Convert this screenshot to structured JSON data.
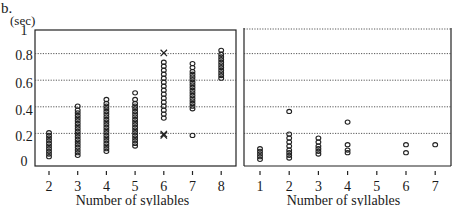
{
  "figure_label": "b.",
  "y_unit": "(sec)",
  "chart_data": [
    {
      "type": "scatter",
      "title": "",
      "xlabel": "Number of syllables",
      "ylabel": "(sec)",
      "xlim": [
        2,
        8
      ],
      "ylim": [
        0,
        1
      ],
      "xticks": [
        2,
        3,
        4,
        5,
        6,
        7,
        8
      ],
      "yticks": [
        0,
        0.2,
        0.4,
        0.6,
        0.8,
        1
      ],
      "ytick_labels": [
        "0",
        "0.2",
        "0.4",
        "0.6",
        "0.8",
        "1"
      ],
      "grid": "horizontal dotted at 0.2, 0.4, 0.6, 0.8",
      "series": [
        {
          "name": "circles",
          "marker": "o",
          "points": [
            [
              2,
              0.04
            ],
            [
              2,
              0.06
            ],
            [
              2,
              0.08
            ],
            [
              2,
              0.1
            ],
            [
              2,
              0.12
            ],
            [
              2,
              0.14
            ],
            [
              2,
              0.16
            ],
            [
              2,
              0.18
            ],
            [
              2,
              0.2
            ],
            [
              2,
              0.22
            ],
            [
              3,
              0.05
            ],
            [
              3,
              0.07
            ],
            [
              3,
              0.09
            ],
            [
              3,
              0.11
            ],
            [
              3,
              0.13
            ],
            [
              3,
              0.15
            ],
            [
              3,
              0.17
            ],
            [
              3,
              0.19
            ],
            [
              3,
              0.21
            ],
            [
              3,
              0.23
            ],
            [
              3,
              0.25
            ],
            [
              3,
              0.27
            ],
            [
              3,
              0.29
            ],
            [
              3,
              0.31
            ],
            [
              3,
              0.33
            ],
            [
              3,
              0.35
            ],
            [
              3,
              0.37
            ],
            [
              3,
              0.39
            ],
            [
              3,
              0.42
            ],
            [
              4,
              0.08
            ],
            [
              4,
              0.1
            ],
            [
              4,
              0.12
            ],
            [
              4,
              0.14
            ],
            [
              4,
              0.16
            ],
            [
              4,
              0.18
            ],
            [
              4,
              0.2
            ],
            [
              4,
              0.22
            ],
            [
              4,
              0.24
            ],
            [
              4,
              0.26
            ],
            [
              4,
              0.28
            ],
            [
              4,
              0.3
            ],
            [
              4,
              0.32
            ],
            [
              4,
              0.34
            ],
            [
              4,
              0.36
            ],
            [
              4,
              0.38
            ],
            [
              4,
              0.4
            ],
            [
              4,
              0.42
            ],
            [
              4,
              0.44
            ],
            [
              4,
              0.47
            ],
            [
              5,
              0.12
            ],
            [
              5,
              0.14
            ],
            [
              5,
              0.16
            ],
            [
              5,
              0.18
            ],
            [
              5,
              0.2
            ],
            [
              5,
              0.22
            ],
            [
              5,
              0.24
            ],
            [
              5,
              0.26
            ],
            [
              5,
              0.28
            ],
            [
              5,
              0.3
            ],
            [
              5,
              0.32
            ],
            [
              5,
              0.34
            ],
            [
              5,
              0.36
            ],
            [
              5,
              0.38
            ],
            [
              5,
              0.4
            ],
            [
              5,
              0.42
            ],
            [
              5,
              0.44
            ],
            [
              5,
              0.47
            ],
            [
              5,
              0.52
            ],
            [
              6,
              0.33
            ],
            [
              6,
              0.36
            ],
            [
              6,
              0.39
            ],
            [
              6,
              0.42
            ],
            [
              6,
              0.45
            ],
            [
              6,
              0.48
            ],
            [
              6,
              0.51
            ],
            [
              6,
              0.54
            ],
            [
              6,
              0.57
            ],
            [
              6,
              0.6
            ],
            [
              6,
              0.63
            ],
            [
              6,
              0.66
            ],
            [
              6,
              0.69
            ],
            [
              6,
              0.72
            ],
            [
              6,
              0.75
            ],
            [
              7,
              0.2
            ],
            [
              7,
              0.4
            ],
            [
              7,
              0.42
            ],
            [
              7,
              0.44
            ],
            [
              7,
              0.46
            ],
            [
              7,
              0.48
            ],
            [
              7,
              0.5
            ],
            [
              7,
              0.52
            ],
            [
              7,
              0.54
            ],
            [
              7,
              0.56
            ],
            [
              7,
              0.58
            ],
            [
              7,
              0.6
            ],
            [
              7,
              0.62
            ],
            [
              7,
              0.64
            ],
            [
              7,
              0.66
            ],
            [
              7,
              0.68
            ],
            [
              7,
              0.71
            ],
            [
              7,
              0.74
            ],
            [
              8,
              0.63
            ],
            [
              8,
              0.65
            ],
            [
              8,
              0.67
            ],
            [
              8,
              0.69
            ],
            [
              8,
              0.71
            ],
            [
              8,
              0.73
            ],
            [
              8,
              0.75
            ],
            [
              8,
              0.77
            ],
            [
              8,
              0.79
            ],
            [
              8,
              0.81
            ],
            [
              8,
              0.84
            ]
          ]
        },
        {
          "name": "crosses",
          "marker": "x",
          "points": [
            [
              6,
              0.82
            ],
            [
              6,
              0.2
            ],
            [
              6,
              0.21
            ]
          ]
        }
      ]
    },
    {
      "type": "scatter",
      "title": "",
      "xlabel": "Number of syllables",
      "ylabel": "",
      "xlim": [
        1,
        7
      ],
      "ylim": [
        0,
        1
      ],
      "xticks": [
        1,
        2,
        3,
        4,
        5,
        6,
        7
      ],
      "yticks": [
        0,
        0.2,
        0.4,
        0.6,
        0.8,
        1
      ],
      "grid": "horizontal dotted at 0.2, 0.4, 0.6, 0.8, 1.0",
      "series": [
        {
          "name": "circles",
          "marker": "o",
          "points": [
            [
              1,
              0.02
            ],
            [
              1,
              0.04
            ],
            [
              1,
              0.06
            ],
            [
              1,
              0.08
            ],
            [
              1,
              0.1
            ],
            [
              2,
              0.03
            ],
            [
              2,
              0.05
            ],
            [
              2,
              0.07
            ],
            [
              2,
              0.09
            ],
            [
              2,
              0.12
            ],
            [
              2,
              0.15
            ],
            [
              2,
              0.18
            ],
            [
              2,
              0.21
            ],
            [
              2,
              0.38
            ],
            [
              3,
              0.06
            ],
            [
              3,
              0.08
            ],
            [
              3,
              0.1
            ],
            [
              3,
              0.12
            ],
            [
              3,
              0.15
            ],
            [
              3,
              0.18
            ],
            [
              4,
              0.07
            ],
            [
              4,
              0.09
            ],
            [
              4,
              0.13
            ],
            [
              4,
              0.3
            ],
            [
              6,
              0.07
            ],
            [
              6,
              0.13
            ],
            [
              7,
              0.13
            ]
          ]
        }
      ]
    }
  ]
}
